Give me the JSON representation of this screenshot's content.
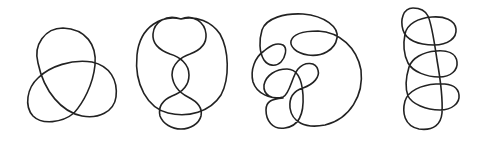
{
  "figure": {
    "background": "#ffffff",
    "stroke_color": "#222222",
    "stroke_width": 1.6,
    "knots": [
      {
        "name": "knot-1-trefoil",
        "crossings": 3,
        "path": "M 38 63 C 30 40 45 27 65 29 C 88 31 98 50 92 75 C 88 95 80 110 72 112 C 60 118 45 122 35 115 C 25 106 28 88 38 78 C 50 64 70 58 90 62 C 108 66 118 80 115 98 C 112 112 98 118 82 115 C 62 110 45 92 38 63 Z"
      },
      {
        "name": "knot-2-figure-eight-chain",
        "crossings": 6,
        "path": "M 180 19 C 150 16 135 40 136 70 C 137 98 150 112 170 115 C 190 118 203 104 200 93 C 197 84 190 80 180 78 C 168 74 165 62 170 55 C 176 48 190 44 189 33 C 188 22 178 19 172 20 C 165 21 160 28 167 40 C 172 48 185 50 188 60 C 192 70 182 76 178 79 C 170 84 165 92 165 102 C 166 118 178 128 190 127 C 205 126 212 112 208 104 C 205 98 200 98 212 96 C 224 94 227 78 224 55 C 221 32 210 18 180 19 Z"
      },
      {
        "name": "knot-3-complex",
        "crossings": 8,
        "path": "M 262 35 C 260 25 275 14 295 14 C 320 15 337 25 336 37 C 335 50 322 57 306 55 C 293 53 287 47 289 40 C 291 33 300 31 318 31 C 338 32 358 45 360 70 C 362 95 345 118 320 122 C 300 125 290 120 290 110 C 288 98 291 92 300 88 C 310 84 318 79 318 72 C 317 63 305 62 298 70 C 292 78 290 95 282 97 C 268 99 262 94 265 84 C 268 74 276 68 288 66 C 300 66 302 80 303 95 C 304 110 300 125 287 128 C 272 130 266 122 266 110 C 266 97 277 95 290 95 C 296 95 298 97 300 98 C 280 99 258 95 255 80 C 252 68 255 58 260 50 C 265 45 270 44 277 42 C 283 40 285 46 283 54 C 281 62 276 65 270 64 C 263 63 263 45 262 35 Z"
      },
      {
        "name": "knot-4-twisted-coil",
        "crossings": 7,
        "path": "M 413 12 C 400 12 402 30 405 38 C 409 44 420 46 432 46 C 446 45 456 40 455 30 C 454 20 444 16 432 17 C 420 18 408 22 405 32 C 402 40 403 52 407 60 C 412 70 428 77 440 77 C 452 77 458 70 457 62 C 455 53 447 50 436 51 C 422 52 410 58 408 68 C 406 78 405 88 408 95 C 412 103 425 110 440 110 C 452 109 460 102 459 94 C 458 85 450 83 436 84 C 420 85 408 90 405 100 C 402 110 402 125 418 128 C 432 130 440 125 441 115 C 442 100 440 80 437 65 C 434 45 430 30 425 20 C 422 14 418 12 413 12 Z"
      }
    ]
  }
}
